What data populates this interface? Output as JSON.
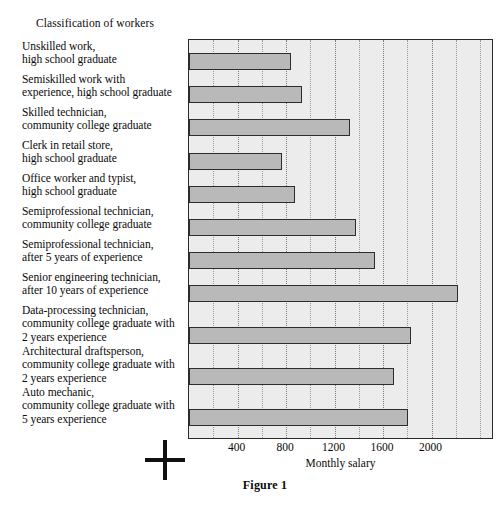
{
  "chart_data": {
    "type": "bar",
    "orientation": "horizontal",
    "title": "Classification of workers",
    "xlabel": "Monthly salary",
    "ylabel": "",
    "caption": "Figure 1",
    "xlim": [
      0,
      2515
    ],
    "xticks": [
      400,
      800,
      1200,
      1600,
      2000
    ],
    "xtick_labels": [
      "400",
      "800",
      "1200",
      "1600",
      "2000"
    ],
    "minor_tick_step": 200,
    "grid": true,
    "legend": "none",
    "bar_fill_color": "#b9b9b9",
    "bar_edge_color": "#2d2d2d",
    "plot_background_color": "#ececec",
    "categories": [
      "Unskilled work,\nhigh school graduate",
      "Semiskilled work with\nexperience, high school graduate",
      "Skilled technician,\ncommunity college graduate",
      "Clerk in retail store,\nhigh school graduate",
      "Office worker and typist,\nhigh school graduate",
      "Semiprofessional technician,\ncommunity college graduate",
      "Semiprofessional technician,\nafter 5 years of experience",
      "Senior engineering technician,\nafter 10 years of experience",
      "Data-processing technician,\ncommunity college graduate with\n2 years experience",
      "Architectural draftsperson,\ncommunity college graduate with\n2 years experience",
      "Auto mechanic,\ncommunity college graduate with\n5 years experience"
    ],
    "values": [
      840,
      930,
      1330,
      765,
      870,
      1375,
      1530,
      2215,
      1830,
      1690,
      1805
    ]
  }
}
